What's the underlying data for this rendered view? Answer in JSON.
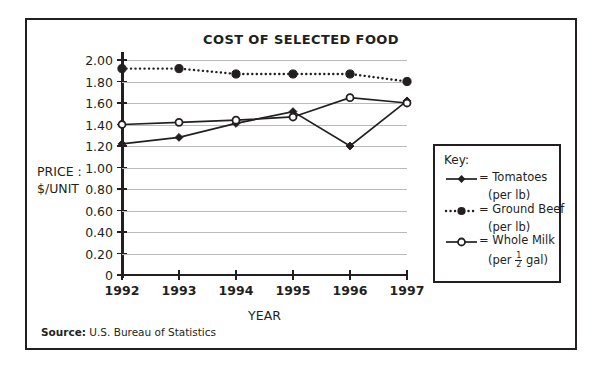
{
  "figure": {
    "title": "COST OF SELECTED FOOD",
    "source_label": "Source:",
    "source_text": "U.S. Bureau of Statistics"
  },
  "axes": {
    "y_label_line1": "PRICE :",
    "y_label_line2": "$/UNIT",
    "x_title": "YEAR"
  },
  "legend": {
    "title": "Key:",
    "items": [
      {
        "marker": "filled-diamond-solid-line",
        "label": "= Tomatoes",
        "sub": "(per lb)"
      },
      {
        "marker": "filled-circle-dotted-line",
        "label": "= Ground Beef",
        "sub": "(per lb)"
      },
      {
        "marker": "open-circle-solid-line",
        "label": "= Whole Milk",
        "sub_prefix": "(per ",
        "sub_num": "1",
        "sub_den": "2",
        "sub_suffix": " gal)"
      }
    ]
  },
  "chart_data": {
    "type": "line",
    "title": "COST OF SELECTED FOOD",
    "xlabel": "YEAR",
    "ylabel": "PRICE : $/UNIT",
    "categories": [
      "1992",
      "1993",
      "1994",
      "1995",
      "1996",
      "1997"
    ],
    "x": [
      1992,
      1993,
      1994,
      1995,
      1996,
      1997
    ],
    "ylim": [
      0,
      2.0
    ],
    "yticks": [
      0,
      0.2,
      0.4,
      0.6,
      0.8,
      1.0,
      1.2,
      1.4,
      1.6,
      1.8,
      2.0
    ],
    "ytick_labels": [
      "0",
      "0.20",
      "0.40",
      "0.60",
      "0.80",
      "1.00",
      "1.20",
      "1.40",
      "1.60",
      "1.80",
      "2.00"
    ],
    "grid": "horizontal",
    "legend_position": "right",
    "series": [
      {
        "name": "Tomatoes (per lb)",
        "marker": "filled-diamond",
        "line_style": "solid",
        "color": "#231f20",
        "values": [
          1.22,
          1.28,
          1.41,
          1.52,
          1.2,
          1.62
        ]
      },
      {
        "name": "Ground Beef (per lb)",
        "marker": "filled-circle",
        "line_style": "dotted",
        "color": "#231f20",
        "values": [
          1.92,
          1.92,
          1.87,
          1.87,
          1.87,
          1.8
        ]
      },
      {
        "name": "Whole Milk (per 1/2 gal)",
        "marker": "open-circle",
        "line_style": "solid",
        "color": "#231f20",
        "values": [
          1.4,
          1.42,
          1.44,
          1.47,
          1.65,
          1.6
        ]
      }
    ]
  }
}
